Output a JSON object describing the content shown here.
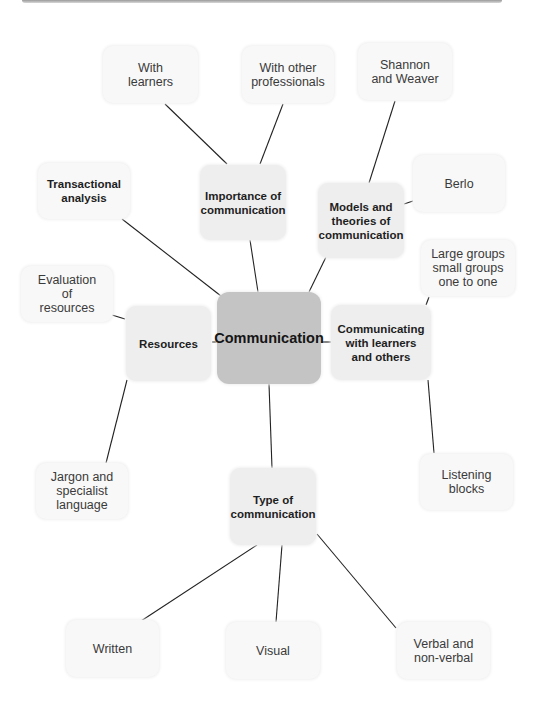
{
  "diagram": {
    "type": "mind-map",
    "center": {
      "id": "communication",
      "label": "Communication"
    },
    "nodes": [
      {
        "id": "importance",
        "label": "Importance of\ncommunication",
        "level": "main"
      },
      {
        "id": "models",
        "label": "Models and\ntheories of\ncommunication",
        "level": "main"
      },
      {
        "id": "communicating",
        "label": "Communicating\nwith learners\nand others",
        "level": "main"
      },
      {
        "id": "type",
        "label": "Type of\ncommunication",
        "level": "main"
      },
      {
        "id": "resources",
        "label": "Resources",
        "level": "main"
      },
      {
        "id": "transactional",
        "label": "Transactional\nanalysis",
        "level": "main-bold-light"
      },
      {
        "id": "with_learners",
        "label": "With\nlearners",
        "level": "sub"
      },
      {
        "id": "with_professionals",
        "label": "With other\nprofessionals",
        "level": "sub"
      },
      {
        "id": "shannon",
        "label": "Shannon\nand Weaver",
        "level": "sub"
      },
      {
        "id": "berlo",
        "label": "Berlo",
        "level": "sub"
      },
      {
        "id": "groups",
        "label": "Large groups\nsmall groups\none to one",
        "level": "sub"
      },
      {
        "id": "listening",
        "label": "Listening\nblocks",
        "level": "sub"
      },
      {
        "id": "written",
        "label": "Written",
        "level": "sub"
      },
      {
        "id": "visual",
        "label": "Visual",
        "level": "sub"
      },
      {
        "id": "verbal",
        "label": "Verbal and\nnon-verbal",
        "level": "sub"
      },
      {
        "id": "evaluation",
        "label": "Evaluation\nof\nresources",
        "level": "sub"
      },
      {
        "id": "jargon",
        "label": "Jargon and\nspecialist\nlanguage",
        "level": "sub"
      }
    ],
    "edges": [
      [
        "communication",
        "importance"
      ],
      [
        "communication",
        "models"
      ],
      [
        "communication",
        "communicating"
      ],
      [
        "communication",
        "type"
      ],
      [
        "communication",
        "resources"
      ],
      [
        "communication",
        "transactional"
      ],
      [
        "importance",
        "with_learners"
      ],
      [
        "importance",
        "with_professionals"
      ],
      [
        "models",
        "shannon"
      ],
      [
        "models",
        "berlo"
      ],
      [
        "communicating",
        "groups"
      ],
      [
        "communicating",
        "listening"
      ],
      [
        "type",
        "written"
      ],
      [
        "type",
        "visual"
      ],
      [
        "type",
        "verbal"
      ],
      [
        "resources",
        "evaluation"
      ],
      [
        "resources",
        "jargon"
      ]
    ]
  },
  "labels": {
    "communication": "Communication",
    "importance": "Importance of\ncommunication",
    "models": "Models and\ntheories of\ncommunication",
    "communicating": "Communicating\nwith learners\nand others",
    "type": "Type of\ncommunication",
    "resources": "Resources",
    "transactional": "Transactional\nanalysis",
    "with_learners": "With\nlearners",
    "with_professionals": "With other\nprofessionals",
    "shannon": "Shannon\nand Weaver",
    "berlo": "Berlo",
    "groups": "Large groups\nsmall groups\none to one",
    "listening": "Listening\nblocks",
    "written": "Written",
    "visual": "Visual",
    "verbal": "Verbal and\nnon-verbal",
    "evaluation": "Evaluation\nof\nresources",
    "jargon": "Jargon and\nspecialist\nlanguage"
  },
  "colors": {
    "center_fill": "#c4c4c4",
    "main_fill": "#eeeeee",
    "sub_fill": "#f7f7f7",
    "line": "#222222"
  }
}
